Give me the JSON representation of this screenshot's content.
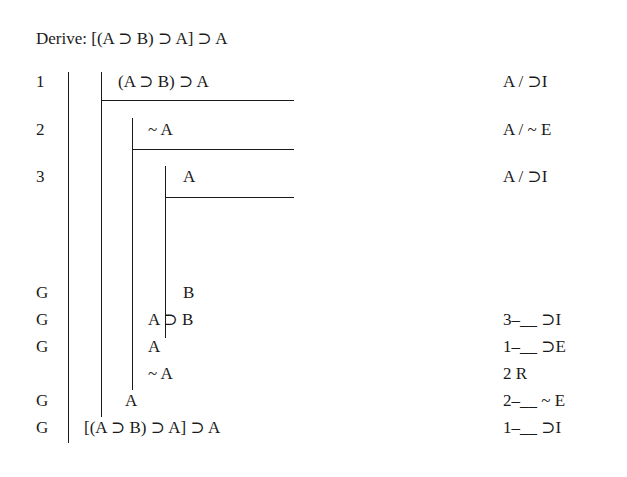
{
  "title": "Derive: [(A ⊃ B) ⊃ A] ⊃ A",
  "rows": [
    {
      "num": "1",
      "formula": "(A ⊃ B) ⊃ A",
      "justification": "A / ⊃I"
    },
    {
      "num": "2",
      "formula": "~ A",
      "justification": "A / ~ E"
    },
    {
      "num": "3",
      "formula": "A",
      "justification": "A / ⊃I"
    },
    {
      "num": "G",
      "formula": "B",
      "justification": ""
    },
    {
      "num": "G",
      "formula": "A ⊃ B",
      "justification": "3–__ ⊃I"
    },
    {
      "num": "G",
      "formula": "A",
      "justification": "1–__ ⊃E"
    },
    {
      "num": "",
      "formula": "~ A",
      "justification": "2 R"
    },
    {
      "num": "G",
      "formula": "A",
      "justification": "2–__ ~ E"
    },
    {
      "num": "G",
      "formula": "[(A ⊃ B) ⊃ A] ⊃ A",
      "justification": "1–__ ⊃I"
    }
  ]
}
